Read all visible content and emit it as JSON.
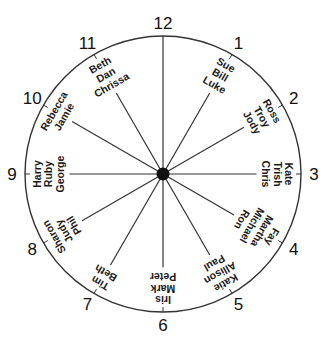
{
  "diagram": {
    "type": "clock-seating-chart",
    "center": {
      "x": 163,
      "y": 174
    },
    "radius": 138,
    "colors": {
      "stroke": "#333333",
      "hub": "#111111",
      "text": "#1a1a1a"
    },
    "hours": [
      {
        "label": "12",
        "names": []
      },
      {
        "label": "1",
        "names": [
          "Sue",
          "Bill",
          "Luke"
        ]
      },
      {
        "label": "2",
        "names": [
          "Ross",
          "Troy",
          "Jody"
        ]
      },
      {
        "label": "3",
        "names": [
          "Kate",
          "Trish",
          "Chris"
        ]
      },
      {
        "label": "4",
        "names": [
          "Fay",
          "Martha",
          "Michael",
          "Ron"
        ]
      },
      {
        "label": "5",
        "names": [
          "Katie",
          "Allison",
          "Paul"
        ]
      },
      {
        "label": "6",
        "names": [
          "Iris",
          "Mark",
          "Peter"
        ]
      },
      {
        "label": "7",
        "names": [
          "Tim",
          "Beth"
        ]
      },
      {
        "label": "8",
        "names": [
          "Sharon",
          "Judy",
          "Phil"
        ]
      },
      {
        "label": "9",
        "names": [
          "Harry",
          "Ruby",
          "George"
        ]
      },
      {
        "label": "10",
        "names": [
          "Rebecca",
          "Jamie"
        ]
      },
      {
        "label": "11",
        "names": [
          "Beth",
          "Dan",
          "Chrissa"
        ]
      }
    ]
  }
}
